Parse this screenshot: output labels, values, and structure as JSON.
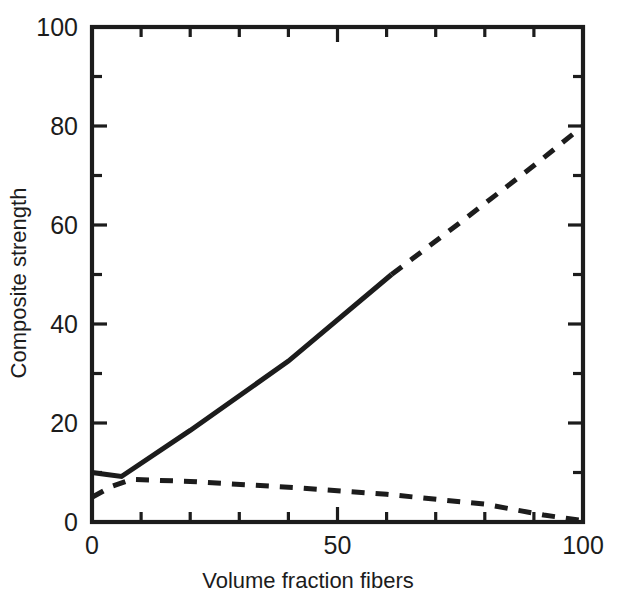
{
  "chart_data": {
    "type": "line",
    "title": "",
    "subtitle": "",
    "xlabel": "Volume fraction fibers",
    "ylabel": "Composite strength",
    "xlim": [
      0,
      100
    ],
    "ylim": [
      0,
      100
    ],
    "grid": false,
    "legend": "none",
    "x_ticks_major": [
      0,
      50,
      100
    ],
    "x_tick_labels": [
      "0",
      "50",
      "100"
    ],
    "x_ticks_minor": [
      10,
      20,
      30,
      40,
      60,
      70,
      80,
      90
    ],
    "y_ticks_major": [
      0,
      20,
      40,
      60,
      80,
      100
    ],
    "y_tick_labels": [
      "0",
      "20",
      "40",
      "60",
      "80",
      "100"
    ],
    "y_ticks_minor": [
      10,
      30,
      50,
      70,
      90
    ],
    "axis_color": "#1c1c1c",
    "line_color": "#1c1c1c",
    "series": [
      {
        "name": "composite-strength-solid",
        "style": "solid",
        "x": [
          0,
          3,
          6,
          20,
          40,
          61
        ],
        "values": [
          10,
          9.6,
          9.2,
          18.5,
          32.5,
          50
        ]
      },
      {
        "name": "composite-strength-extrapolated",
        "style": "dashed",
        "x": [
          61,
          75,
          90,
          100
        ],
        "values": [
          50,
          60.5,
          72,
          80
        ]
      },
      {
        "name": "matrix-contribution-dashed",
        "style": "dashed",
        "x": [
          0,
          4,
          8,
          20,
          42,
          60,
          80,
          92,
          100
        ],
        "values": [
          5,
          7.2,
          8.6,
          8.2,
          6.9,
          5.6,
          3.6,
          1.4,
          0.3
        ]
      }
    ]
  },
  "axes": {
    "x_title": "Volume fraction fibers",
    "y_title": "Composite strength"
  },
  "labels": {
    "y": [
      "100",
      "80",
      "60",
      "40",
      "20",
      "0"
    ],
    "x": [
      "0",
      "50",
      "100"
    ]
  }
}
